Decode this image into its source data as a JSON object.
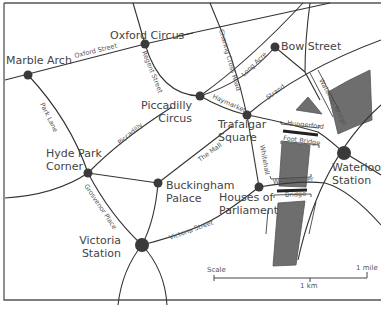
{
  "map": {
    "title": "Central London",
    "colors": {
      "river": "#6e6e6e",
      "road": "#333333",
      "node": "#3a3a3a",
      "text": "#444444"
    },
    "places": [
      {
        "id": "marble-arch",
        "label": [
          "Marble Arch"
        ],
        "x": 28,
        "y": 75,
        "r": 4.5,
        "lx": 6,
        "ly": 64,
        "anchor": "start"
      },
      {
        "id": "oxford-circus",
        "label": [
          "Oxford Circus"
        ],
        "x": 145,
        "y": 44,
        "r": 4.5,
        "lx": 110,
        "ly": 39,
        "anchor": "start"
      },
      {
        "id": "bow-street",
        "label": [
          "Bow Street"
        ],
        "x": 275,
        "y": 47,
        "r": 4.5,
        "lx": 281,
        "ly": 50,
        "anchor": "start"
      },
      {
        "id": "piccadilly-circus",
        "label": [
          "Piccadilly",
          "Circus"
        ],
        "x": 200,
        "y": 96,
        "r": 4.5,
        "lx": 192,
        "ly": 109,
        "anchor": "end"
      },
      {
        "id": "trafalgar-square",
        "label": [
          "Trafalgar",
          "Square"
        ],
        "x": 247,
        "y": 115,
        "r": 4.5,
        "lx": 218,
        "ly": 128,
        "anchor": "start"
      },
      {
        "id": "hyde-park-corner",
        "label": [
          "Hyde Park",
          "Corner"
        ],
        "x": 88,
        "y": 173,
        "r": 4.5,
        "lx": 46,
        "ly": 157,
        "anchor": "start"
      },
      {
        "id": "buckingham-palace",
        "label": [
          "Buckingham",
          "Palace"
        ],
        "x": 158,
        "y": 183,
        "r": 4.5,
        "lx": 166,
        "ly": 189,
        "anchor": "start"
      },
      {
        "id": "houses-of-parliament",
        "label": [
          "Houses of",
          "Parliament"
        ],
        "x": 259,
        "y": 187,
        "r": 4.5,
        "lx": 219,
        "ly": 201,
        "anchor": "start"
      },
      {
        "id": "waterloo-station",
        "label": [
          "Waterloo",
          "Station"
        ],
        "x": 344,
        "y": 153,
        "r": 7,
        "lx": 332,
        "ly": 171,
        "anchor": "start"
      },
      {
        "id": "victoria-station",
        "label": [
          "Victoria",
          "Station"
        ],
        "x": 142,
        "y": 245,
        "r": 7,
        "lx": 121,
        "ly": 244,
        "anchor": "end"
      }
    ],
    "roads": [
      {
        "id": "oxford-street",
        "d": "M5 80 L145 44 L193 33"
      },
      {
        "id": "oxford-east",
        "d": "M178 36 L330 3"
      },
      {
        "id": "marble-arch-north",
        "d": "M133 3 L145 44"
      },
      {
        "id": "park-lane",
        "d": "M28 75 Q70 120 88 173"
      },
      {
        "id": "hyde-park-west",
        "d": "M5 198 Q55 195 88 173"
      },
      {
        "id": "regent-street",
        "d": "M145 44 Q160 95 200 96"
      },
      {
        "id": "piccadilly",
        "d": "M88 173 Q120 140 172 107"
      },
      {
        "id": "constitution",
        "d": "M88 173 L158 183"
      },
      {
        "id": "the-mall",
        "d": "M158 183 L232 126"
      },
      {
        "id": "haymarket",
        "d": "M200 96 Q225 110 247 115"
      },
      {
        "id": "charing-cross-road",
        "d": "M210 3 Q235 60 247 115"
      },
      {
        "id": "long-acre",
        "d": "M200 96 Q250 60 303 3"
      },
      {
        "id": "bow-street-road",
        "d": "M200 96 Q245 82 275 47 L305 72"
      },
      {
        "id": "strand",
        "d": "M247 115 Q300 70 381 40"
      },
      {
        "id": "bow-north",
        "d": "M310 3 Q305 40 305 72 Q312 85 320 100"
      },
      {
        "id": "whitehall",
        "d": "M247 115 L259 187"
      },
      {
        "id": "hungerford-road",
        "d": "M247 115 Q275 120 318 132 Q330 140 344 153"
      },
      {
        "id": "waterloo-curve",
        "d": "M298 260 Q320 160 381 105"
      },
      {
        "id": "westminster-road",
        "d": "M259 187 Q300 180 325 183 Q350 190 381 225"
      },
      {
        "id": "waterloo-east",
        "d": "M340 150 L381 175"
      },
      {
        "id": "buckingham-south",
        "d": "M158 183 Q155 220 142 245"
      },
      {
        "id": "grosvenor-place",
        "d": "M88 173 Q110 215 142 245"
      },
      {
        "id": "victoria-street",
        "d": "M142 245 Q200 230 225 212 Q240 202 259 187"
      },
      {
        "id": "victoria-sw",
        "d": "M142 245 Q122 270 118 305"
      },
      {
        "id": "victoria-se",
        "d": "M142 245 Q165 270 167 305"
      }
    ],
    "streets": [
      {
        "label": "Oxford Street",
        "x": 75,
        "y": 58,
        "rot": -14
      },
      {
        "label": "Regent Street",
        "x": 142,
        "y": 52,
        "rot": 68
      },
      {
        "label": "Charing Cross Road",
        "x": 219,
        "y": 30,
        "rot": 74
      },
      {
        "label": "Long Acre",
        "x": 244,
        "y": 77,
        "rot": -44
      },
      {
        "label": "Haymarket",
        "x": 212,
        "y": 98,
        "rot": 24
      },
      {
        "label": "Strand",
        "x": 268,
        "y": 100,
        "rot": -36
      },
      {
        "label": "Park Lane",
        "x": 40,
        "y": 104,
        "rot": 64
      },
      {
        "label": "Piccadilly",
        "x": 120,
        "y": 145,
        "rot": -40
      },
      {
        "label": "The Mall",
        "x": 200,
        "y": 162,
        "rot": -36
      },
      {
        "label": "Whitehall",
        "x": 260,
        "y": 145,
        "rot": 80
      },
      {
        "label": "Grosvenor Place",
        "x": 84,
        "y": 186,
        "rot": 56
      },
      {
        "label": "Victoria Street",
        "x": 170,
        "y": 240,
        "rot": -20
      }
    ],
    "bridges": [
      {
        "label": "Hungerford",
        "x": 287,
        "y": 125,
        "rot": 6
      },
      {
        "label": "Foot Bridge",
        "x": 283,
        "y": 140,
        "rot": 8
      },
      {
        "label": "Westminster",
        "x": 273,
        "y": 184,
        "rot": -4
      },
      {
        "label": "Bridge",
        "x": 285,
        "y": 197,
        "rot": -3
      },
      {
        "label": "Waterloo Bridge",
        "x": 319,
        "y": 80,
        "rot": 62
      }
    ],
    "scale": {
      "label": "Scale",
      "km_label": "1 km",
      "mile_label": "1 mile"
    }
  }
}
